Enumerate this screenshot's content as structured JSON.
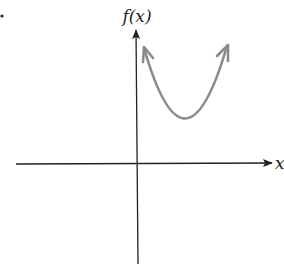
{
  "figure": {
    "y_axis_label": "f(x)",
    "x_axis_label": "x",
    "bullet": "•",
    "curve": {
      "type": "parabola opening upward",
      "color": "#8a8a8a",
      "vertex_above_x_axis": true,
      "vertex_right_of_y_axis": true
    },
    "axis_color": "#222222"
  }
}
